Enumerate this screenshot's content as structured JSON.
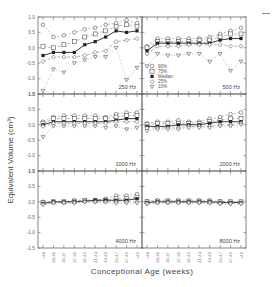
{
  "figure": {
    "ylabel": "Equivalent Volume (cm³)",
    "xlabel": "Conceptional Age (weeks)"
  },
  "legend": {
    "entries": [
      {
        "label": "90%",
        "marker": "circle"
      },
      {
        "label": "75%",
        "marker": "square"
      },
      {
        "label": "Median",
        "marker": "filled-square"
      },
      {
        "label": "25%",
        "marker": "diamond"
      },
      {
        "label": "10%",
        "marker": "triangle-down"
      }
    ]
  },
  "chart_data": {
    "type": "line",
    "title": "",
    "xlabel": "Conceptional Age (weeks)",
    "ylabel": "Equivalent Volume (cm³)",
    "categories": [
      "<33",
      "33-35",
      "35-37",
      "37-39",
      "39-41",
      "41-43",
      "43-45",
      "45-47",
      "47-49",
      ">49"
    ],
    "yticks": [
      "1.0",
      "0.5",
      "0.0",
      "-0.5",
      "-1.0",
      "-1.5"
    ],
    "ylim": [
      -1.5,
      1.0
    ],
    "grid": false,
    "legend_position": "inside 500 Hz panel, lower left",
    "panels": [
      {
        "label": "250 Hz",
        "series": [
          {
            "name": "90%",
            "values": [
              0.75,
              0.35,
              0.4,
              0.5,
              0.6,
              0.65,
              0.75,
              0.8,
              0.9,
              0.8
            ]
          },
          {
            "name": "75%",
            "values": [
              0.05,
              0.0,
              0.1,
              0.2,
              0.35,
              0.45,
              0.55,
              0.7,
              0.75,
              0.7
            ]
          },
          {
            "name": "Median",
            "values": [
              -0.25,
              -0.15,
              -0.15,
              -0.15,
              0.1,
              0.2,
              0.35,
              0.55,
              0.5,
              0.55
            ]
          },
          {
            "name": "25%",
            "values": [
              -0.45,
              -0.3,
              -0.3,
              -0.3,
              -0.25,
              -0.15,
              -0.1,
              0.2,
              0.25,
              0.3
            ]
          },
          {
            "name": "10%",
            "values": [
              -1.4,
              -0.7,
              -0.8,
              -0.5,
              -0.4,
              -0.3,
              -0.3,
              0.0,
              -1.05,
              -0.65
            ]
          }
        ]
      },
      {
        "label": "500 Hz",
        "series": [
          {
            "name": "90%",
            "values": [
              0.05,
              0.3,
              0.3,
              0.3,
              0.3,
              0.3,
              0.35,
              0.45,
              0.55,
              0.65
            ]
          },
          {
            "name": "75%",
            "values": [
              0.0,
              0.2,
              0.2,
              0.2,
              0.2,
              0.25,
              0.25,
              0.35,
              0.45,
              0.45
            ]
          },
          {
            "name": "Median",
            "values": [
              -0.1,
              0.15,
              0.15,
              0.15,
              0.15,
              0.15,
              0.15,
              0.25,
              0.3,
              0.3
            ]
          },
          {
            "name": "25%",
            "values": [
              -0.2,
              0.05,
              0.05,
              0.05,
              0.1,
              0.1,
              0.1,
              0.1,
              0.05,
              0.05
            ]
          },
          {
            "name": "10%",
            "values": [
              -0.6,
              -0.2,
              -0.25,
              -0.25,
              -0.2,
              -0.2,
              -0.45,
              -0.2,
              -0.75,
              -0.45
            ]
          }
        ]
      },
      {
        "label": "1000 Hz",
        "series": [
          {
            "name": "90%",
            "values": [
              0.1,
              0.25,
              0.3,
              0.3,
              0.3,
              0.3,
              0.25,
              0.35,
              0.4,
              0.4
            ]
          },
          {
            "name": "75%",
            "values": [
              0.05,
              0.2,
              0.2,
              0.2,
              0.2,
              0.2,
              0.2,
              0.25,
              0.3,
              0.3
            ]
          },
          {
            "name": "Median",
            "values": [
              0.0,
              0.1,
              0.1,
              0.1,
              0.1,
              0.1,
              0.1,
              0.15,
              0.2,
              0.2
            ]
          },
          {
            "name": "25%",
            "values": [
              -0.05,
              0.05,
              0.05,
              0.05,
              0.05,
              0.05,
              0.05,
              0.1,
              0.1,
              0.1
            ]
          },
          {
            "name": "10%",
            "values": [
              -0.4,
              -0.05,
              -0.05,
              -0.05,
              -0.05,
              -0.05,
              -0.1,
              -0.05,
              -0.15,
              -0.1
            ]
          }
        ]
      },
      {
        "label": "2000 Hz",
        "series": [
          {
            "name": "90%",
            "values": [
              0.05,
              0.1,
              0.1,
              0.15,
              0.1,
              0.1,
              0.2,
              0.25,
              0.35,
              0.4
            ]
          },
          {
            "name": "75%",
            "values": [
              0.0,
              0.05,
              0.05,
              0.05,
              0.05,
              0.05,
              0.1,
              0.15,
              0.2,
              0.2
            ]
          },
          {
            "name": "Median",
            "values": [
              -0.05,
              -0.05,
              -0.05,
              0.0,
              0.0,
              0.0,
              0.05,
              0.1,
              0.1,
              0.1
            ]
          },
          {
            "name": "25%",
            "values": [
              -0.1,
              -0.1,
              -0.1,
              -0.1,
              -0.05,
              -0.05,
              -0.05,
              0.0,
              0.0,
              0.05
            ]
          },
          {
            "name": "10%",
            "values": [
              -0.2,
              -0.15,
              -0.15,
              -0.15,
              -0.1,
              -0.1,
              -0.1,
              -0.05,
              -0.05,
              0.0
            ]
          }
        ]
      },
      {
        "label": "4000 Hz",
        "series": [
          {
            "name": "90%",
            "values": [
              0.0,
              0.0,
              0.0,
              0.05,
              0.05,
              0.05,
              0.1,
              0.2,
              0.2,
              0.25
            ]
          },
          {
            "name": "75%",
            "values": [
              -0.02,
              0.0,
              0.0,
              0.02,
              0.05,
              0.05,
              0.05,
              0.1,
              0.1,
              0.15
            ]
          },
          {
            "name": "Median",
            "values": [
              -0.05,
              0.0,
              0.0,
              0.0,
              0.02,
              0.05,
              0.05,
              0.05,
              0.05,
              0.1
            ]
          },
          {
            "name": "25%",
            "values": [
              -0.08,
              -0.02,
              -0.02,
              -0.02,
              0.0,
              0.0,
              0.0,
              0.0,
              0.0,
              0.0
            ]
          },
          {
            "name": "10%",
            "values": [
              -0.1,
              -0.05,
              -0.05,
              -0.05,
              -0.02,
              -0.02,
              -0.02,
              -0.05,
              -0.05,
              -0.05
            ]
          }
        ]
      },
      {
        "label": "8000 Hz",
        "series": [
          {
            "name": "90%",
            "values": [
              0.02,
              0.05,
              0.05,
              0.05,
              0.05,
              0.05,
              0.05,
              0.02,
              0.0,
              0.0
            ]
          },
          {
            "name": "75%",
            "values": [
              0.0,
              0.02,
              0.02,
              0.02,
              0.02,
              0.02,
              0.0,
              0.0,
              0.0,
              0.0
            ]
          },
          {
            "name": "Median",
            "values": [
              -0.02,
              0.0,
              0.0,
              0.0,
              0.0,
              0.0,
              0.0,
              -0.02,
              -0.02,
              -0.02
            ]
          },
          {
            "name": "25%",
            "values": [
              -0.05,
              -0.02,
              -0.02,
              -0.02,
              -0.02,
              -0.02,
              -0.02,
              -0.05,
              -0.05,
              -0.05
            ]
          },
          {
            "name": "10%",
            "values": [
              -0.08,
              -0.05,
              -0.05,
              -0.05,
              -0.05,
              -0.05,
              -0.05,
              -0.08,
              -0.08,
              -0.08
            ]
          }
        ]
      }
    ]
  }
}
